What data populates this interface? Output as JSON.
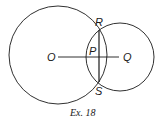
{
  "diagram": {
    "caption": "Ex. 18",
    "points": {
      "O": "O",
      "P": "P",
      "Q": "Q",
      "R": "R",
      "S": "S"
    },
    "circles": [
      {
        "name": "circle-O",
        "cx": 58,
        "cy": 55,
        "r": 49
      },
      {
        "name": "circle-Q",
        "cx": 120,
        "cy": 57,
        "r": 34
      }
    ],
    "segments": [
      {
        "name": "segment-OQ",
        "from": "O",
        "to": "Q"
      },
      {
        "name": "segment-RS",
        "from": "R",
        "to": "S"
      }
    ],
    "colors": {
      "stroke": "#1a1a1a",
      "background": "#ffffff"
    }
  }
}
